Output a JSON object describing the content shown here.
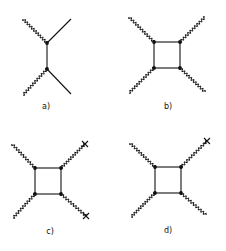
{
  "figure": {
    "panels": [
      {
        "id": "a",
        "label": "a)",
        "type": "tree-level-exchange"
      },
      {
        "id": "b",
        "label": "b)",
        "type": "box-diagram"
      },
      {
        "id": "c",
        "label": "c)",
        "type": "box-diagram-two-crosses"
      },
      {
        "id": "d",
        "label": "d)",
        "type": "box-diagram-one-cross"
      }
    ],
    "colors": {
      "line": "#111111",
      "background": "#ffffff"
    }
  }
}
